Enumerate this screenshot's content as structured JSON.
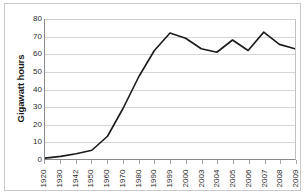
{
  "chart_data": {
    "type": "line",
    "title": "",
    "xlabel": "",
    "ylabel": "Gigawatt hours",
    "ylim": [
      0,
      80
    ],
    "ytick_step": 10,
    "yticks": [
      0,
      10,
      20,
      30,
      40,
      50,
      60,
      70,
      80
    ],
    "ytick_labels": [
      "0",
      "10",
      "20",
      "30",
      "40",
      "50",
      "60",
      "70",
      "80"
    ],
    "grid": true,
    "grid_axis": "y",
    "legend": false,
    "legend_position": "none",
    "categories": [
      "1920",
      "1930",
      "1942",
      "1950",
      "1960",
      "1970",
      "1980",
      "1990",
      "1999",
      "2000",
      "2003",
      "2004",
      "2005",
      "2006",
      "2007",
      "2008",
      "2009"
    ],
    "values": [
      0.5,
      1.5,
      3,
      5,
      13,
      29,
      47,
      62,
      72,
      69,
      63,
      61,
      68,
      62,
      72.5,
      65.5,
      63
    ],
    "series": [
      {
        "name": "Gigawatt hours",
        "color": "#1a1a1a",
        "line_width": 1.6,
        "markers": false,
        "values": [
          0.5,
          1.5,
          3,
          5,
          13,
          29,
          47,
          62,
          72,
          69,
          63,
          61,
          68,
          62,
          72.5,
          65.5,
          63
        ]
      }
    ],
    "annotations": []
  },
  "style": {
    "plot_background": "#ffffff",
    "grid_color": "#d5d5d5",
    "axis_color": "#8a8a8a",
    "frame_color": "#c9c9c9",
    "text_color": "#2b2b2b",
    "line_color": "#1a1a1a"
  }
}
